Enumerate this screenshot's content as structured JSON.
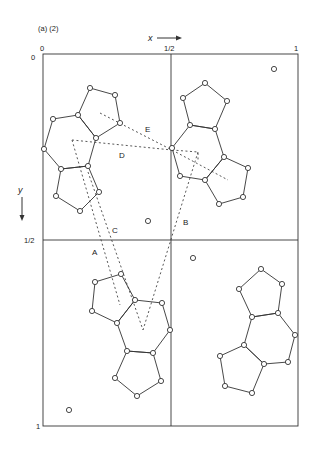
{
  "figure": {
    "panel_label": "(a) (2)",
    "x_axis": {
      "label": "x",
      "ticks": [
        "0",
        "1/2",
        "1"
      ]
    },
    "y_axis": {
      "label": "y",
      "ticks": [
        "0",
        "1/2",
        "1"
      ]
    },
    "contact_labels": [
      "A",
      "B",
      "C",
      "D",
      "E"
    ],
    "colors": {
      "line": "#333333",
      "background": "#ffffff"
    }
  },
  "geometry": {
    "frame": {
      "left": 43,
      "right": 298,
      "top": 54,
      "bottom": 426,
      "mid_x": 171,
      "mid_y": 240
    },
    "molecules": [
      {
        "name": "molecule-top-left",
        "rings": [
          [
            [
              53,
              119
            ],
            [
              78,
              115
            ],
            [
              96,
              138
            ],
            [
              88,
              166
            ],
            [
              61,
              169
            ],
            [
              44,
              149
            ]
          ],
          [
            [
              78,
              115
            ],
            [
              90,
              88
            ],
            [
              115,
              95
            ],
            [
              120,
              123
            ],
            [
              96,
              138
            ]
          ],
          [
            [
              61,
              169
            ],
            [
              88,
              166
            ],
            [
              99,
              192
            ],
            [
              80,
              211
            ],
            [
              56,
              196
            ]
          ]
        ]
      },
      {
        "name": "molecule-top-right",
        "rings": [
          [
            [
              190,
              125
            ],
            [
              215,
              129
            ],
            [
              224,
              157
            ],
            [
              205,
              180
            ],
            [
              180,
              176
            ],
            [
              172,
              148
            ]
          ],
          [
            [
              190,
              125
            ],
            [
              183,
              98
            ],
            [
              205,
              83
            ],
            [
              227,
              101
            ],
            [
              215,
              129
            ]
          ],
          [
            [
              224,
              157
            ],
            [
              248,
              168
            ],
            [
              243,
              197
            ],
            [
              219,
              204
            ],
            [
              205,
              180
            ]
          ]
        ]
      },
      {
        "name": "molecule-bottom-left",
        "rings": [
          [
            [
              135,
              300
            ],
            [
              162,
              303
            ],
            [
              170,
              330
            ],
            [
              153,
              353
            ],
            [
              127,
              351
            ],
            [
              117,
              323
            ]
          ],
          [
            [
              95,
              282
            ],
            [
              121,
              274
            ],
            [
              135,
              300
            ],
            [
              117,
              323
            ],
            [
              92,
              311
            ]
          ],
          [
            [
              127,
              351
            ],
            [
              153,
              353
            ],
            [
              161,
              381
            ],
            [
              137,
              396
            ],
            [
              115,
              378
            ]
          ]
        ]
      },
      {
        "name": "molecule-bottom-right",
        "rings": [
          [
            [
              252,
              317
            ],
            [
              278,
              313
            ],
            [
              295,
              335
            ],
            [
              288,
              362
            ],
            [
              264,
              364
            ],
            [
              244,
              345
            ]
          ],
          [
            [
              261,
              269
            ],
            [
              282,
              284
            ],
            [
              278,
              313
            ],
            [
              252,
              317
            ],
            [
              239,
              289
            ]
          ],
          [
            [
              244,
              345
            ],
            [
              264,
              364
            ],
            [
              252,
              393
            ],
            [
              225,
              386
            ],
            [
              220,
              356
            ]
          ]
        ]
      }
    ],
    "isolated_atoms": [
      [
        274,
        69
      ],
      [
        148,
        221
      ],
      [
        193,
        258
      ],
      [
        69,
        410
      ]
    ],
    "dashed_lines": [
      {
        "id": "E",
        "points": [
          [
            100,
            113
          ],
          [
            172,
            150
          ],
          [
            228,
            180
          ]
        ]
      },
      {
        "id": "D",
        "points": [
          [
            72,
            140
          ],
          [
            172,
            150
          ]
        ]
      },
      {
        "id": "marker",
        "points": [
          [
            172,
            150
          ],
          [
            198,
            152
          ],
          [
            198,
            162
          ]
        ]
      },
      {
        "id": "A",
        "points": [
          [
            72,
            140
          ],
          [
            120,
            305
          ]
        ]
      },
      {
        "id": "C",
        "points": [
          [
            88,
            172
          ],
          [
            143,
            330
          ]
        ]
      },
      {
        "id": "B",
        "points": [
          [
            198,
            152
          ],
          [
            143,
            330
          ]
        ]
      }
    ],
    "label_positions": {
      "A": [
        92,
        255
      ],
      "B": [
        183,
        225
      ],
      "C": [
        112,
        233
      ],
      "D": [
        119,
        158
      ],
      "E": [
        145,
        132
      ]
    }
  }
}
